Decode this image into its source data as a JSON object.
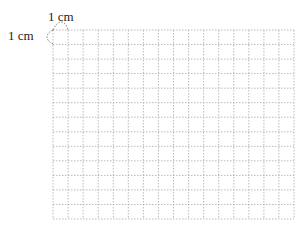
{
  "diagram": {
    "type": "square-grid",
    "columns": 16,
    "rows": 13,
    "cell_size_label": "1 cm",
    "labels": {
      "top": "1 cm",
      "left": "1 cm"
    },
    "line_style": "dotted",
    "line_color": "#a8a8a8",
    "annotation_color": "#555555"
  }
}
